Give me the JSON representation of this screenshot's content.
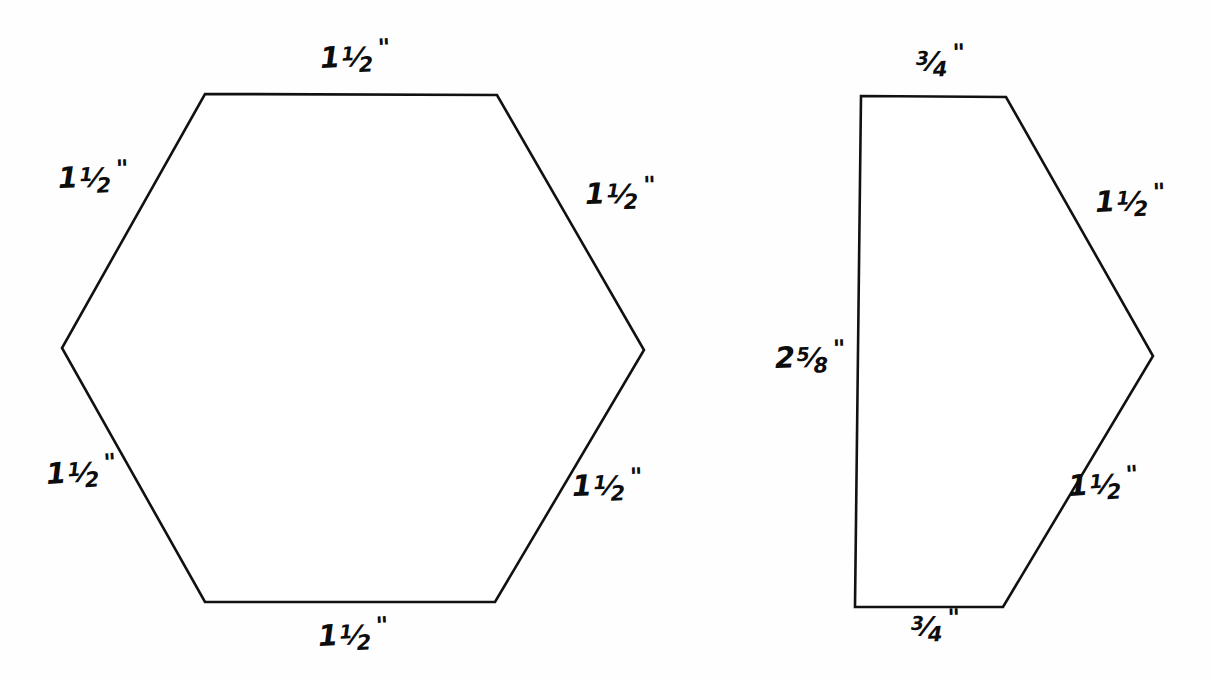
{
  "page": {
    "background_color": "#fefefe",
    "ink_color": "#111111",
    "width": 1211,
    "height": 680
  },
  "figures": [
    {
      "id": "hexagon",
      "name": "regular-hexagon-template",
      "vertices": [
        [
          205,
          94
        ],
        [
          497,
          95
        ],
        [
          644,
          350
        ],
        [
          495,
          602
        ],
        [
          205,
          602
        ],
        [
          62,
          348
        ]
      ],
      "labels": [
        {
          "id": "hex-top",
          "text": "1 1/2\"",
          "whole": "1",
          "num": "1",
          "den": "2",
          "unit": "\"",
          "x": 320,
          "y": 44,
          "side": "top"
        },
        {
          "id": "hex-upper-left",
          "text": "1 1/2\"",
          "whole": "1",
          "num": "1",
          "den": "2",
          "unit": "\"",
          "x": 58,
          "y": 164,
          "side": "upper-left"
        },
        {
          "id": "hex-upper-right",
          "text": "1 1/2\"",
          "whole": "1",
          "num": "1",
          "den": "2",
          "unit": "\"",
          "x": 585,
          "y": 180,
          "side": "upper-right"
        },
        {
          "id": "hex-lower-left",
          "text": "1 1/2\"",
          "whole": "1",
          "num": "1",
          "den": "2",
          "unit": "\"",
          "x": 46,
          "y": 460,
          "side": "lower-left"
        },
        {
          "id": "hex-lower-right",
          "text": "1 1/2\"",
          "whole": "1",
          "num": "1",
          "den": "2",
          "unit": "\"",
          "x": 572,
          "y": 472,
          "side": "lower-right"
        },
        {
          "id": "hex-bottom",
          "text": "1 1/2\"",
          "whole": "1",
          "num": "1",
          "den": "2",
          "unit": "\"",
          "x": 318,
          "y": 622,
          "side": "bottom"
        }
      ]
    },
    {
      "id": "pentagon",
      "name": "half-hexagon-template",
      "vertices": [
        [
          861,
          96
        ],
        [
          1006,
          97
        ],
        [
          1153,
          356
        ],
        [
          1003,
          607
        ],
        [
          855,
          607
        ]
      ],
      "labels": [
        {
          "id": "pent-top",
          "text": "3/4\"",
          "whole": "",
          "num": "3",
          "den": "4",
          "unit": "\"",
          "x": 915,
          "y": 47,
          "side": "top"
        },
        {
          "id": "pent-upper-right",
          "text": "1 1/2\"",
          "whole": "1",
          "num": "1",
          "den": "2",
          "unit": "\"",
          "x": 1095,
          "y": 188,
          "side": "upper-right"
        },
        {
          "id": "pent-left",
          "text": "2 5/8\"",
          "whole": "2",
          "num": "5",
          "den": "8",
          "unit": "\"",
          "x": 775,
          "y": 344,
          "side": "left"
        },
        {
          "id": "pent-lower-right",
          "text": "1 1/2\"",
          "whole": "1",
          "num": "1",
          "den": "2",
          "unit": "\"",
          "x": 1068,
          "y": 472,
          "side": "lower-right"
        },
        {
          "id": "pent-bottom",
          "text": "3/4\"",
          "whole": "",
          "num": "3",
          "den": "4",
          "unit": "\"",
          "x": 910,
          "y": 612,
          "side": "bottom"
        }
      ]
    }
  ]
}
